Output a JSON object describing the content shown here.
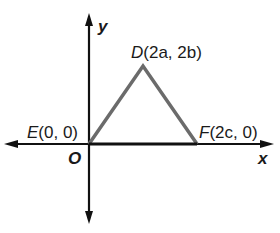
{
  "diagram": {
    "type": "coordinate-geometry-triangle",
    "axes": {
      "x_label": "x",
      "y_label": "y",
      "origin_label": "O"
    },
    "points": [
      {
        "name": "E",
        "coords": "(0, 0)"
      },
      {
        "name": "D",
        "coords": "(2a, 2b)"
      },
      {
        "name": "F",
        "coords": "(2c, 0)"
      }
    ],
    "colors": {
      "axes": "#111111",
      "triangle": "#6b6b6b",
      "text": "#1a1a1a"
    }
  }
}
